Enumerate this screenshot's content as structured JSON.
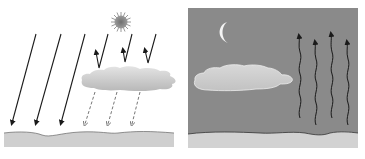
{
  "diagram": {
    "panels": [
      {
        "id": "day",
        "background": "#ffffff",
        "ground_color": "#cfcfcf",
        "sky_element": "sun-icon",
        "incoming_arrows": 3,
        "reflected_arrows": 3,
        "diffuse_arrows": 3
      },
      {
        "id": "night",
        "background": "#8a8a8a",
        "ground_color": "#d2d2d2",
        "sky_element": "moon-icon",
        "outgoing_wavy_arrows": 4
      }
    ],
    "colors": {
      "arrow": "#1a1a1a",
      "dashed_arrow": "#666666",
      "cloud_light": "#e6e6e6",
      "cloud_dark": "#b5b5b5",
      "sun_core": "#7a7a7a",
      "sun_rays": "#9a9a9a",
      "moon": "#f4f4f4",
      "ground_line": "#555555"
    }
  }
}
